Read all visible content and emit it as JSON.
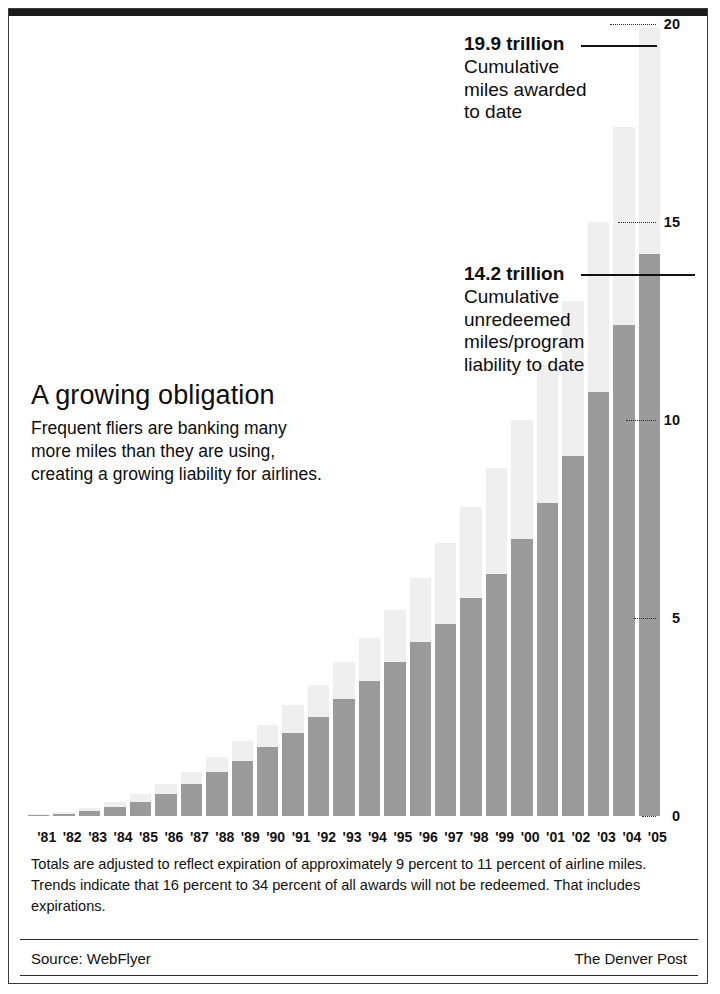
{
  "chart_data": {
    "type": "bar",
    "title": "A growing obligation",
    "subtitle_lines": [
      "Frequent fliers are banking many",
      "more miles than they are using,",
      "creating a growing liability for airlines."
    ],
    "xlabel": "",
    "ylabel": "",
    "ylim": [
      0,
      20
    ],
    "yticks": [
      0,
      5,
      10,
      15,
      20
    ],
    "ytick_labels": [
      "0",
      "5",
      "10",
      "15",
      "20"
    ],
    "grid": false,
    "legend_position": "annotations",
    "units": "trillion miles",
    "stacked": true,
    "categories": [
      "'81",
      "'82",
      "'83",
      "'84",
      "'85",
      "'86",
      "'87",
      "'88",
      "'89",
      "'90",
      "'91",
      "'92",
      "'93",
      "'94",
      "'95",
      "'96",
      "'97",
      "'98",
      "'99",
      "'00",
      "'01",
      "'02",
      "'03",
      "'04",
      "'05"
    ],
    "series": [
      {
        "name": "Cumulative miles awarded to date",
        "color": "#efefef",
        "values": [
          0.05,
          0.1,
          0.2,
          0.35,
          0.55,
          0.8,
          1.1,
          1.5,
          1.9,
          2.3,
          2.8,
          3.3,
          3.9,
          4.5,
          5.2,
          6.0,
          6.9,
          7.8,
          8.8,
          10.0,
          11.4,
          13.0,
          15.0,
          17.4,
          19.9
        ]
      },
      {
        "name": "Cumulative unredeemed miles/program liability to date",
        "color": "#9b9b9b",
        "values": [
          0.03,
          0.06,
          0.12,
          0.22,
          0.35,
          0.55,
          0.8,
          1.1,
          1.4,
          1.75,
          2.1,
          2.5,
          2.95,
          3.4,
          3.9,
          4.4,
          4.85,
          5.5,
          6.1,
          7.0,
          7.9,
          9.1,
          10.7,
          12.4,
          14.2
        ]
      }
    ],
    "annotations": [
      {
        "id": "awarded",
        "value": "19.9 trillion",
        "description_lines": [
          "Cumulative",
          "miles awarded",
          "to date"
        ],
        "points_to_year": "'05",
        "points_to_value": 19.9
      },
      {
        "id": "liability",
        "value": "14.2 trillion",
        "description_lines": [
          "Cumulative",
          "unredeemed",
          "miles/program",
          "liability to date"
        ],
        "points_to_year": "'05",
        "points_to_value": 14.2
      }
    ]
  },
  "footnote": {
    "lines": [
      "Totals are adjusted to reflect expiration of approximately 9 percent to 11 percent of airline miles.",
      "Trends indicate that 16 percent to 34 percent of all awards will not be redeemed. That includes",
      "expirations."
    ]
  },
  "source_bar": {
    "source": "Source: WebFlyer",
    "publisher": "The Denver Post"
  },
  "colors": {
    "bar_awarded": "#efefef",
    "bar_liability": "#9b9b9b",
    "text": "#111111",
    "rule": "#2b2b2b"
  }
}
